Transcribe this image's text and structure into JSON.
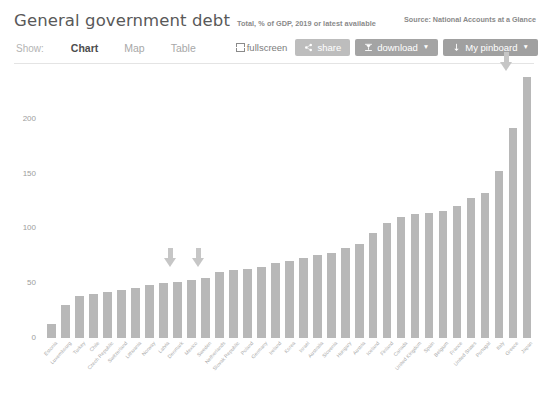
{
  "header": {
    "title": "General government debt",
    "subtitle": "Total, % of GDP, 2019 or latest available",
    "source": "Source: National Accounts at a Glance"
  },
  "toolbar": {
    "show_label": "Show:",
    "tabs": [
      {
        "label": "Chart",
        "active": true
      },
      {
        "label": "Map",
        "active": false
      },
      {
        "label": "Table",
        "active": false
      }
    ],
    "fullscreen_label": "fullscreen",
    "share_label": "share",
    "download_label": "download",
    "pinboard_label": "My pinboard",
    "caret": "▼",
    "share_color": "#bdbdbd",
    "download_color": "#a4a4a4",
    "pinboard_color": "#a0a0a0"
  },
  "chart_data": {
    "type": "bar",
    "title": "General government debt",
    "subtitle": "Total, % of GDP, 2019 or latest available",
    "xlabel": "",
    "ylabel": "",
    "ylim": [
      0,
      250
    ],
    "yticks": [
      0,
      50,
      100,
      150,
      200
    ],
    "grid": false,
    "legend": null,
    "bar_color": "#b8b8b8",
    "categories": [
      "Estonia",
      "Luxembourg",
      "Turkey",
      "Chile",
      "Czech Republic",
      "Switzerland",
      "Lithuania",
      "Norway",
      "Latvia",
      "Denmark",
      "Mexico",
      "Sweden",
      "Netherlands",
      "Slovak Republic",
      "Poland",
      "Germany",
      "Ireland",
      "Korea",
      "Israel",
      "Australia",
      "Slovenia",
      "Hungary",
      "Austria",
      "Iceland",
      "Finland",
      "Canada",
      "United Kingdom",
      "Spain",
      "Belgium",
      "France",
      "United States",
      "Portugal",
      "Italy",
      "Greece",
      "Japan"
    ],
    "values": [
      13,
      30,
      38,
      40,
      42,
      44,
      46,
      48,
      50,
      51,
      53,
      55,
      60,
      62,
      63,
      65,
      68,
      70,
      73,
      76,
      78,
      82,
      86,
      96,
      105,
      110,
      113,
      114,
      116,
      120,
      128,
      132,
      152,
      192,
      238
    ]
  },
  "cursors": [
    {
      "name": "pointer-arrow-left",
      "left": 164,
      "top": 248
    },
    {
      "name": "pointer-arrow-middle",
      "left": 192,
      "top": 248
    },
    {
      "name": "pointer-arrow-top-right",
      "left": 500,
      "top": 52
    }
  ]
}
